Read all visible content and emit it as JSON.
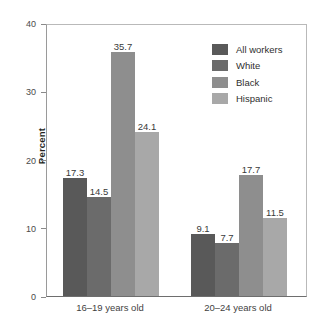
{
  "chart_data": {
    "type": "bar",
    "title": "",
    "xlabel": "",
    "ylabel": "Percent",
    "ylim": [
      0,
      40
    ],
    "yticks": [
      0,
      10,
      20,
      30,
      40
    ],
    "ytick_labels": [
      "0",
      "10",
      "20",
      "30",
      "40"
    ],
    "grid": false,
    "legend_position": "upper right",
    "categories": [
      "16–19 years old",
      "20–24 years old"
    ],
    "series": [
      {
        "name": "All workers",
        "color": "#595959",
        "values": [
          17.3,
          9.1
        ]
      },
      {
        "name": "White",
        "color": "#6b6b6b",
        "values": [
          14.5,
          7.7
        ]
      },
      {
        "name": "Black",
        "color": "#8e8e8e",
        "values": [
          35.7,
          17.7
        ]
      },
      {
        "name": "Hispanic",
        "color": "#a8a8a8",
        "values": [
          24.1,
          11.5
        ]
      }
    ],
    "value_labels": [
      [
        "17.3",
        "14.5",
        "35.7",
        "24.1"
      ],
      [
        "9.1",
        "7.7",
        "17.7",
        "11.5"
      ]
    ]
  },
  "legend": {
    "items": [
      {
        "label": "All workers"
      },
      {
        "label": "White"
      },
      {
        "label": "Black"
      },
      {
        "label": "Hispanic"
      }
    ]
  },
  "axes": {
    "y_title": "Percent"
  }
}
